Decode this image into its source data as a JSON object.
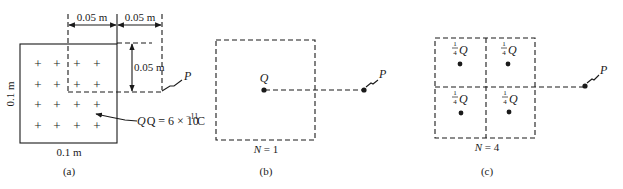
{
  "panels": {
    "a": {
      "caption": "(a)",
      "dim_top_left": "0.05 m",
      "dim_top_right": "0.05 m",
      "dim_right": "0.05 m",
      "side_left": "0.1 m",
      "side_bottom": "0.1 m",
      "point_label": "P",
      "charge_label_prefix": "Q = 6 × 10",
      "charge_exponent": "−11",
      "charge_unit": " C",
      "plus_symbol": "+"
    },
    "b": {
      "caption": "(b)",
      "n_label": "N = 1",
      "charge_label": "Q",
      "point_label": "P"
    },
    "c": {
      "caption": "(c)",
      "n_label": "N = 4",
      "quarter_num": "1",
      "quarter_den": "4",
      "quarter_q": "Q",
      "point_label": "P"
    }
  }
}
